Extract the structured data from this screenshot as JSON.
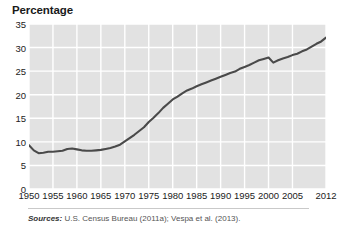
{
  "chart_title": "Percentage",
  "sources": {
    "label": "Sources:",
    "text": " U.S. Census Bureau (2011a); Vespa et al. (2013)."
  },
  "style": {
    "plot_background": "#e2e2e2",
    "gridline_color": "#ffffff",
    "line_color": "#4a4a4a",
    "text_color": "#222222",
    "page_background": "#ffffff"
  },
  "chart_data": {
    "type": "line",
    "title": "Percentage",
    "subtitle": "",
    "xlabel": "",
    "ylabel": "Percentage",
    "xlim": [
      1950,
      2012
    ],
    "ylim": [
      0,
      35
    ],
    "grid": true,
    "legend": "none",
    "y_ticks": [
      35,
      30,
      25,
      20,
      15,
      10,
      5,
      0
    ],
    "x_ticks": [
      1950,
      1955,
      1960,
      1965,
      1970,
      1975,
      1980,
      1985,
      1990,
      1995,
      2000,
      2005,
      2012
    ],
    "series": [
      {
        "name": "Percentage",
        "x": [
          1950,
          1951,
          1952,
          1953,
          1954,
          1955,
          1956,
          1957,
          1958,
          1959,
          1960,
          1961,
          1962,
          1963,
          1964,
          1965,
          1966,
          1967,
          1968,
          1969,
          1970,
          1971,
          1972,
          1973,
          1974,
          1975,
          1976,
          1977,
          1978,
          1979,
          1980,
          1981,
          1982,
          1983,
          1984,
          1985,
          1986,
          1987,
          1988,
          1989,
          1990,
          1991,
          1992,
          1993,
          1994,
          1995,
          1996,
          1997,
          1998,
          1999,
          2000,
          2001,
          2002,
          2003,
          2004,
          2005,
          2006,
          2007,
          2008,
          2009,
          2010,
          2011,
          2012
        ],
        "values": [
          9.3,
          8.2,
          7.6,
          7.7,
          7.9,
          7.9,
          8.0,
          8.1,
          8.5,
          8.6,
          8.4,
          8.2,
          8.1,
          8.1,
          8.2,
          8.3,
          8.5,
          8.7,
          9.0,
          9.4,
          10.1,
          10.8,
          11.5,
          12.3,
          13.1,
          14.2,
          15.1,
          16.1,
          17.2,
          18.1,
          19.0,
          19.6,
          20.3,
          20.9,
          21.3,
          21.8,
          22.2,
          22.6,
          23.0,
          23.4,
          23.8,
          24.2,
          24.6,
          24.9,
          25.5,
          25.9,
          26.3,
          26.8,
          27.3,
          27.6,
          27.9,
          26.8,
          27.3,
          27.7,
          28.0,
          28.4,
          28.7,
          29.2,
          29.6,
          30.2,
          30.8,
          31.3,
          32.1
        ]
      }
    ]
  }
}
